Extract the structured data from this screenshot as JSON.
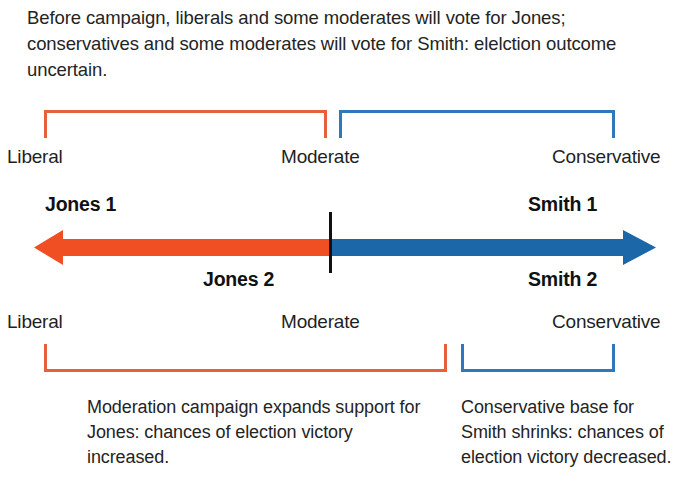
{
  "intro": {
    "text": "Before campaign, liberals and some moderates will vote for Jones; conservatives and some moderates will vote for Smith: elelction outcome uncertain."
  },
  "colors": {
    "orange_arrow": "#f04e23",
    "blue_arrow": "#1c67a8",
    "orange_bracket": "#e7603c",
    "blue_bracket": "#2f78bd",
    "tick": "#111111",
    "text": "#242424",
    "background": "#ffffff"
  },
  "spectrum_top": {
    "labels": {
      "left": "Liberal",
      "center": "Moderate",
      "right": "Conservative"
    },
    "brackets": [
      {
        "name": "liberal-to-moderate",
        "color": "#e7603c",
        "direction": "down"
      },
      {
        "name": "moderate-to-conservative",
        "color": "#2f78bd",
        "direction": "down"
      }
    ]
  },
  "spectrum_bottom": {
    "labels": {
      "left": "Liberal",
      "center": "Moderate",
      "right": "Conservative"
    },
    "brackets": [
      {
        "name": "liberal-to-moderate",
        "color": "#e7603c",
        "direction": "up"
      },
      {
        "name": "conservative",
        "color": "#2f78bd",
        "direction": "up"
      }
    ]
  },
  "axis": {
    "left_half_color": "#f04e23",
    "right_half_color": "#1c67a8",
    "tick_label": "",
    "callouts": {
      "jones_1": "Jones 1",
      "smith_1": "Smith 1",
      "jones_2": "Jones 2",
      "smith_2": "Smith 2"
    }
  },
  "captions": {
    "left": "Moderation campaign expands support for Jones: chances of election victory increased.",
    "right": "Conservative base for Smith shrinks: chances of election victory decreased."
  }
}
